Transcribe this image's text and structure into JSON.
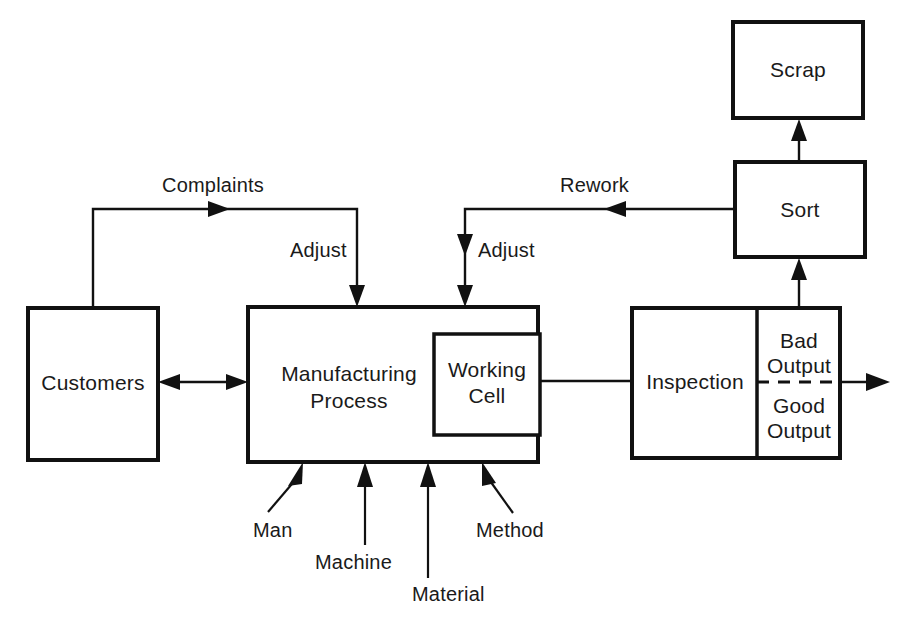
{
  "diagram": {
    "nodes": {
      "customers": {
        "label": "Customers"
      },
      "manufacturing_process": {
        "label_line1": "Manufacturing",
        "label_line2": "Process"
      },
      "working_cell": {
        "label_line1": "Working",
        "label_line2": "Cell"
      },
      "inspection": {
        "label": "Inspection"
      },
      "bad_output": {
        "label_line1": "Bad",
        "label_line2": "Output"
      },
      "good_output": {
        "label_line1": "Good",
        "label_line2": "Output"
      },
      "sort": {
        "label": "Sort"
      },
      "scrap": {
        "label": "Scrap"
      }
    },
    "edge_labels": {
      "complaints": "Complaints",
      "adjust_left": "Adjust",
      "rework": "Rework",
      "adjust_right": "Adjust"
    },
    "inputs": [
      {
        "label": "Man"
      },
      {
        "label": "Machine"
      },
      {
        "label": "Material"
      },
      {
        "label": "Method"
      }
    ],
    "colors": {
      "line": "#111111",
      "background": "#ffffff",
      "text": "#1a1a1a"
    }
  }
}
